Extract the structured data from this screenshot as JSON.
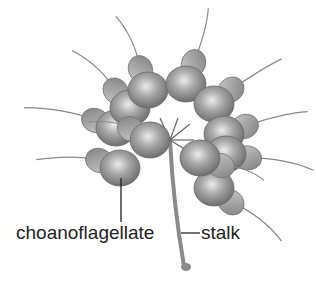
{
  "diagram": {
    "labels": {
      "cell": "choanoflagellate",
      "stalk": "stalk"
    },
    "colors": {
      "cell_fill": "#9a9a9a",
      "cell_highlight": "#e6e6e6",
      "collar_fill": "#b5b5b5",
      "line": "#333333",
      "text": "#222222"
    }
  }
}
